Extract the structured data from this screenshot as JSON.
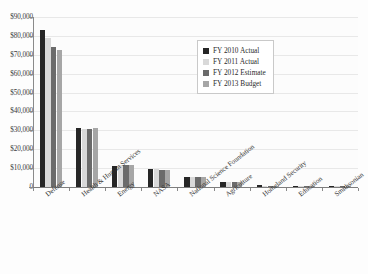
{
  "chart_data": {
    "type": "bar",
    "title": "",
    "subtitle": "",
    "xlabel": "",
    "ylabel": "",
    "ylim": [
      0,
      90000
    ],
    "y_tick_step": 10000,
    "grid": true,
    "legend_position": "inside-top-center",
    "y_ticks": [
      "0",
      "$10,000",
      "$20,000",
      "$30,000",
      "$40,000",
      "$50,000",
      "$60,000",
      "$70,000",
      "$80,000",
      "$90,000"
    ],
    "y_tick_values": [
      0,
      10000,
      20000,
      30000,
      40000,
      50000,
      60000,
      70000,
      80000,
      90000
    ],
    "categories": [
      "Defense",
      "Health & Human Services",
      "Energy",
      "NASA",
      "National Science Foundation",
      "Agriculture",
      "Homeland Security",
      "Education",
      "Smithsonian"
    ],
    "series": [
      {
        "name": "FY 2010 Actual",
        "color": "#262626",
        "values": [
          83000,
          31200,
          11000,
          9500,
          5400,
          2500,
          900,
          300,
          200
        ]
      },
      {
        "name": "FY 2011 Actual",
        "color": "#d9d9d9",
        "values": [
          79000,
          30800,
          11400,
          9300,
          5300,
          2400,
          750,
          250,
          200
        ]
      },
      {
        "name": "FY 2012 Estimate",
        "color": "#6b6b6b",
        "values": [
          74000,
          30900,
          11600,
          9100,
          5400,
          2400,
          700,
          250,
          200
        ]
      },
      {
        "name": "FY 2013 Budget",
        "color": "#a6a6a6",
        "values": [
          72500,
          31100,
          11700,
          9200,
          5500,
          2400,
          700,
          250,
          200
        ]
      }
    ]
  },
  "legend": {
    "items": [
      {
        "label": "FY 2010 Actual",
        "color": "#262626"
      },
      {
        "label": "FY 2011 Actual",
        "color": "#d9d9d9"
      },
      {
        "label": "FY 2012 Estimate",
        "color": "#6b6b6b"
      },
      {
        "label": "FY 2013 Budget",
        "color": "#a6a6a6"
      }
    ]
  },
  "colors": {
    "grid": "#e8e8e8",
    "axis": "#8a8a8a",
    "plot_background": "#fcfcfc",
    "page_background": "#fdfdfd",
    "text": "#2e2e2e"
  }
}
